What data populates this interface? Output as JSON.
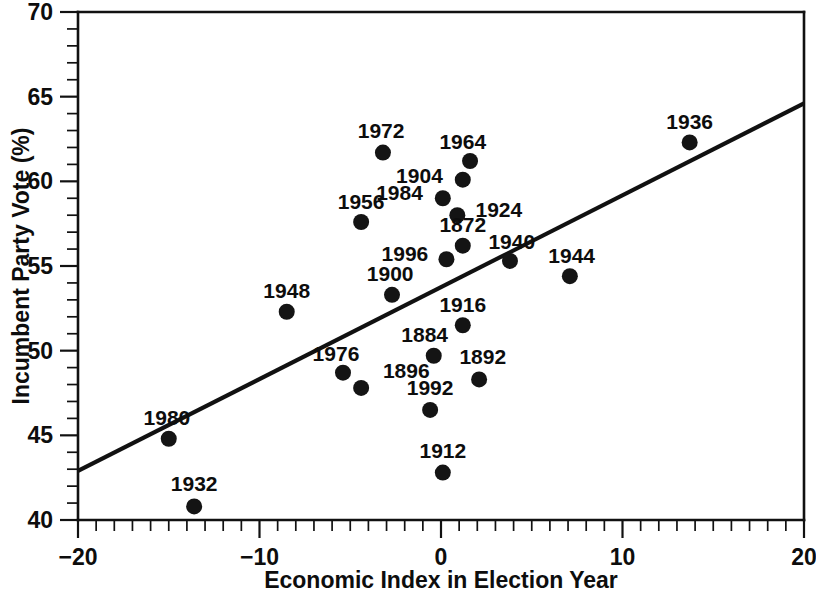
{
  "chart_data": {
    "type": "scatter",
    "title": "",
    "subtitle": "",
    "xlabel": "Economic Index in Election Year",
    "ylabel": "Incumbent Party Vote (%)",
    "xlim": [
      -20,
      20
    ],
    "ylim": [
      40,
      70
    ],
    "x_major_ticks": [
      -20,
      -10,
      0,
      10,
      20
    ],
    "x_major_tick_labels": [
      "−20",
      "−10",
      "0",
      "10",
      "20"
    ],
    "x_minor_tick_step": 1,
    "y_major_ticks": [
      40,
      45,
      50,
      55,
      60,
      65,
      70
    ],
    "y_major_tick_labels": [
      "40",
      "45",
      "50",
      "55",
      "60",
      "65",
      "70"
    ],
    "y_minor_tick_step": 1,
    "grid": false,
    "legend": "none",
    "point_label_field": "label",
    "points": [
      {
        "label": "1872",
        "x": 1.2,
        "y": 56.2,
        "lx": 1.2,
        "ly": 57.4,
        "anchor": "middle"
      },
      {
        "label": "1884",
        "x": -0.4,
        "y": 49.7,
        "lx": -0.9,
        "ly": 50.9,
        "anchor": "middle"
      },
      {
        "label": "1892",
        "x": 2.1,
        "y": 48.3,
        "lx": 2.3,
        "ly": 49.6,
        "anchor": "middle"
      },
      {
        "label": "1896",
        "x": -4.4,
        "y": 47.8,
        "lx": -3.2,
        "ly": 48.8,
        "anchor": "start"
      },
      {
        "label": "1900",
        "x": -2.7,
        "y": 53.3,
        "lx": -2.8,
        "ly": 54.5,
        "anchor": "middle"
      },
      {
        "label": "1904",
        "x": 1.2,
        "y": 60.1,
        "lx": 0.1,
        "ly": 60.3,
        "anchor": "end"
      },
      {
        "label": "1912",
        "x": 0.1,
        "y": 42.8,
        "lx": 0.1,
        "ly": 44.1,
        "anchor": "middle"
      },
      {
        "label": "1916",
        "x": 1.2,
        "y": 51.5,
        "lx": 1.2,
        "ly": 52.7,
        "anchor": "middle"
      },
      {
        "label": "1924",
        "x": 0.9,
        "y": 58.0,
        "lx": 1.9,
        "ly": 58.3,
        "anchor": "start"
      },
      {
        "label": "1932",
        "x": -13.6,
        "y": 40.8,
        "lx": -13.6,
        "ly": 42.1,
        "anchor": "middle"
      },
      {
        "label": "1936",
        "x": 13.7,
        "y": 62.3,
        "lx": 13.7,
        "ly": 63.5,
        "anchor": "middle"
      },
      {
        "label": "1940",
        "x": 3.8,
        "y": 55.3,
        "lx": 3.9,
        "ly": 56.4,
        "anchor": "middle"
      },
      {
        "label": "1944",
        "x": 7.1,
        "y": 54.4,
        "lx": 7.2,
        "ly": 55.6,
        "anchor": "middle"
      },
      {
        "label": "1948",
        "x": -8.5,
        "y": 52.3,
        "lx": -8.5,
        "ly": 53.5,
        "anchor": "middle"
      },
      {
        "label": "1956",
        "x": -4.4,
        "y": 57.6,
        "lx": -4.4,
        "ly": 58.8,
        "anchor": "middle"
      },
      {
        "label": "1964",
        "x": 1.6,
        "y": 61.2,
        "lx": 1.2,
        "ly": 62.3,
        "anchor": "middle"
      },
      {
        "label": "1972",
        "x": -3.2,
        "y": 61.7,
        "lx": -3.3,
        "ly": 63.0,
        "anchor": "middle"
      },
      {
        "label": "1976",
        "x": -5.4,
        "y": 48.7,
        "lx": -4.5,
        "ly": 49.8,
        "anchor": "end"
      },
      {
        "label": "1980",
        "x": -15.0,
        "y": 44.8,
        "lx": -15.1,
        "ly": 46.0,
        "anchor": "middle"
      },
      {
        "label": "1984",
        "x": 0.1,
        "y": 59.0,
        "lx": -1.0,
        "ly": 59.3,
        "anchor": "end"
      },
      {
        "label": "1992",
        "x": -0.6,
        "y": 46.5,
        "lx": -0.6,
        "ly": 47.8,
        "anchor": "middle"
      },
      {
        "label": "1996",
        "x": 0.3,
        "y": 55.4,
        "lx": -0.7,
        "ly": 55.7,
        "anchor": "end"
      }
    ],
    "trendline": {
      "type": "linear-fit",
      "x_start": -20,
      "y_start": 42.9,
      "x_end": 20,
      "y_end": 64.6
    },
    "marker": {
      "shape": "circle",
      "radius_px": 8,
      "color": "#141414"
    },
    "colors": {
      "axis": "#111111",
      "text": "#0d0d0d",
      "marker": "#141414",
      "trendline": "#111111",
      "background": "#ffffff"
    }
  }
}
